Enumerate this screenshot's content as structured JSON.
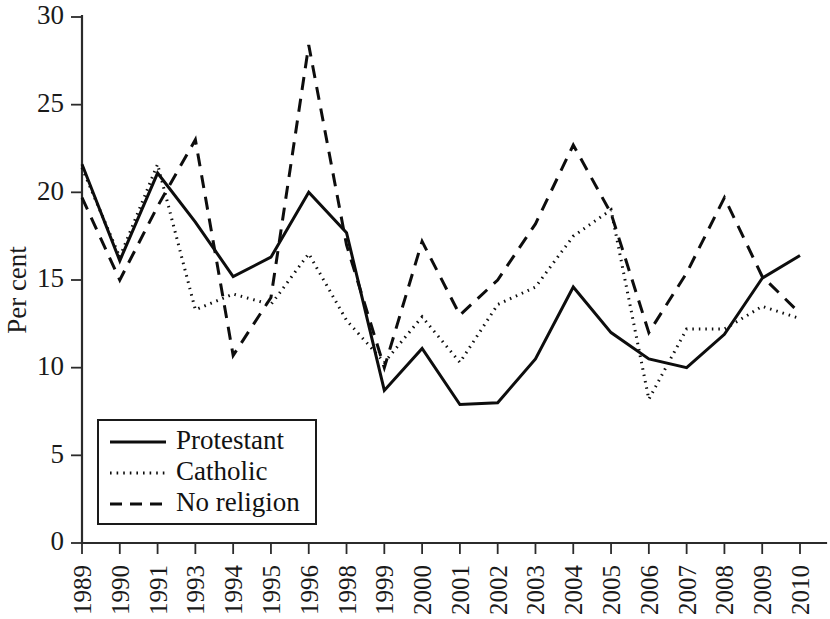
{
  "chart_data": {
    "type": "line",
    "title": "",
    "xlabel": "",
    "ylabel": "Per cent",
    "ylim": [
      0,
      30
    ],
    "yticks": [
      0,
      5,
      10,
      15,
      20,
      25,
      30
    ],
    "grid": false,
    "legend_position": "bottom-left",
    "categories": [
      "1989",
      "1990",
      "1991",
      "1993",
      "1994",
      "1995",
      "1996",
      "1998",
      "1999",
      "2000",
      "2001",
      "2002",
      "2003",
      "2004",
      "2005",
      "2006",
      "2007",
      "2008",
      "2009",
      "2010"
    ],
    "series": [
      {
        "name": "Protestant",
        "style": "solid",
        "values": [
          21.6,
          16.1,
          21.1,
          18.3,
          15.2,
          16.3,
          20.0,
          17.7,
          8.7,
          11.1,
          7.9,
          8.0,
          10.5,
          14.6,
          12.0,
          10.5,
          10.0,
          11.9,
          15.1,
          16.4
        ]
      },
      {
        "name": "Catholic",
        "style": "dotted",
        "values": [
          21.4,
          16.3,
          21.6,
          13.3,
          14.2,
          13.6,
          16.5,
          12.7,
          10.3,
          12.9,
          10.3,
          13.6,
          14.6,
          17.5,
          19.0,
          8.2,
          12.2,
          12.2,
          13.5,
          12.8
        ]
      },
      {
        "name": "No religion",
        "style": "dashed",
        "values": [
          19.7,
          15.0,
          19.2,
          23.0,
          10.7,
          14.0,
          28.4,
          17.0,
          10.0,
          17.2,
          13.0,
          15.0,
          18.2,
          22.7,
          18.8,
          12.0,
          15.4,
          19.7,
          15.2,
          13.1
        ]
      }
    ]
  },
  "legend": {
    "entries": [
      {
        "label": "Protestant"
      },
      {
        "label": "Catholic"
      },
      {
        "label": "No religion"
      }
    ]
  },
  "axes": {
    "y_title": "Per cent"
  }
}
